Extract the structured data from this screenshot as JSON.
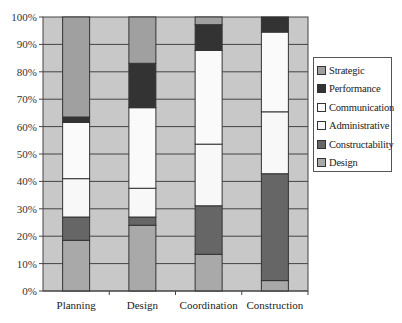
{
  "chart_data": {
    "type": "bar",
    "stacked": true,
    "percent": true,
    "title": "",
    "xlabel": "",
    "ylabel": "",
    "ylim": [
      0,
      100
    ],
    "yticks": [
      "0%",
      "10%",
      "20%",
      "30%",
      "40%",
      "50%",
      "60%",
      "70%",
      "80%",
      "90%",
      "100%"
    ],
    "grid": true,
    "legend_position": "right",
    "categories": [
      "Planning",
      "Design",
      "Coordination",
      "Construction"
    ],
    "series": [
      {
        "name": "Design",
        "color": "#a9a9a9",
        "values": [
          18.5,
          24,
          13.4,
          3.8
        ]
      },
      {
        "name": "Constructability",
        "color": "#666666",
        "values": [
          8.5,
          3,
          17.7,
          39
        ]
      },
      {
        "name": "Administrative",
        "color": "#f8f8f8",
        "values": [
          14,
          10.5,
          22.5,
          22.6
        ]
      },
      {
        "name": "Communication",
        "color": "#fafafa",
        "values": [
          20.5,
          29.4,
          34.2,
          29.1
        ]
      },
      {
        "name": "Performance",
        "color": "#333333",
        "values": [
          2,
          16.2,
          9.4,
          5.5
        ]
      },
      {
        "name": "Strategic",
        "color": "#a0a0a0",
        "values": [
          36.5,
          16.9,
          2.8,
          0
        ]
      }
    ]
  },
  "legend": {
    "items": [
      {
        "label": "Strategic",
        "color": "#a0a0a0"
      },
      {
        "label": "Performance",
        "color": "#333333"
      },
      {
        "label": "Communication",
        "color": "#fafafa"
      },
      {
        "label": "Administrative",
        "color": "#f8f8f8"
      },
      {
        "label": "Constructability",
        "color": "#666666"
      },
      {
        "label": "Design",
        "color": "#a9a9a9"
      }
    ]
  }
}
